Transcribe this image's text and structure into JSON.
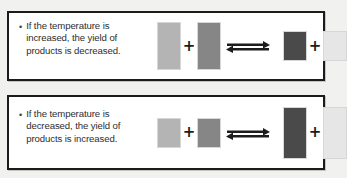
{
  "figure": {
    "background_color": "#f1f1f0",
    "panel_background": "#ffffff",
    "panel_border_color": "#1b1b1b"
  },
  "palette": {
    "reactant_light": "#b4b4b4",
    "reactant_medium": "#868686",
    "product_dark": "#4a4a4a",
    "product_pale": "#e6e6e6",
    "bar_outline": "#d7d7d7",
    "text": "#2e2e2e",
    "arrow": "#1c1c1c"
  },
  "panels": [
    {
      "id": "panel-temperature-increased",
      "bullet_glyph": "•",
      "statement": "If the temperature is\nincreased, the yield of\nproducts is decreased.",
      "arrow": {
        "name": "equilibrium-double-arrow",
        "top_direction": "right",
        "bottom_direction": "left"
      },
      "plus_glyph": "+",
      "reactants": [
        {
          "label": "reactant-a",
          "color": "#b4b4b4",
          "height_px": 48
        },
        {
          "label": "reactant-b",
          "color": "#868686",
          "height_px": 48
        }
      ],
      "products": [
        {
          "label": "product-c",
          "color": "#4a4a4a",
          "height_px": 30
        },
        {
          "label": "product-d",
          "color": "#e6e6e6",
          "height_px": 30
        }
      ]
    },
    {
      "id": "panel-temperature-decreased",
      "bullet_glyph": "•",
      "statement": "If the temperature is\ndecreased, the yield of\nproducts is increased.",
      "arrow": {
        "name": "equilibrium-double-arrow",
        "top_direction": "right",
        "bottom_direction": "left"
      },
      "plus_glyph": "+",
      "reactants": [
        {
          "label": "reactant-a",
          "color": "#b4b4b4",
          "height_px": 30
        },
        {
          "label": "reactant-b",
          "color": "#868686",
          "height_px": 30
        }
      ],
      "products": [
        {
          "label": "product-c",
          "color": "#4a4a4a",
          "height_px": 52
        },
        {
          "label": "product-d",
          "color": "#e6e6e6",
          "height_px": 52
        }
      ]
    }
  ]
}
